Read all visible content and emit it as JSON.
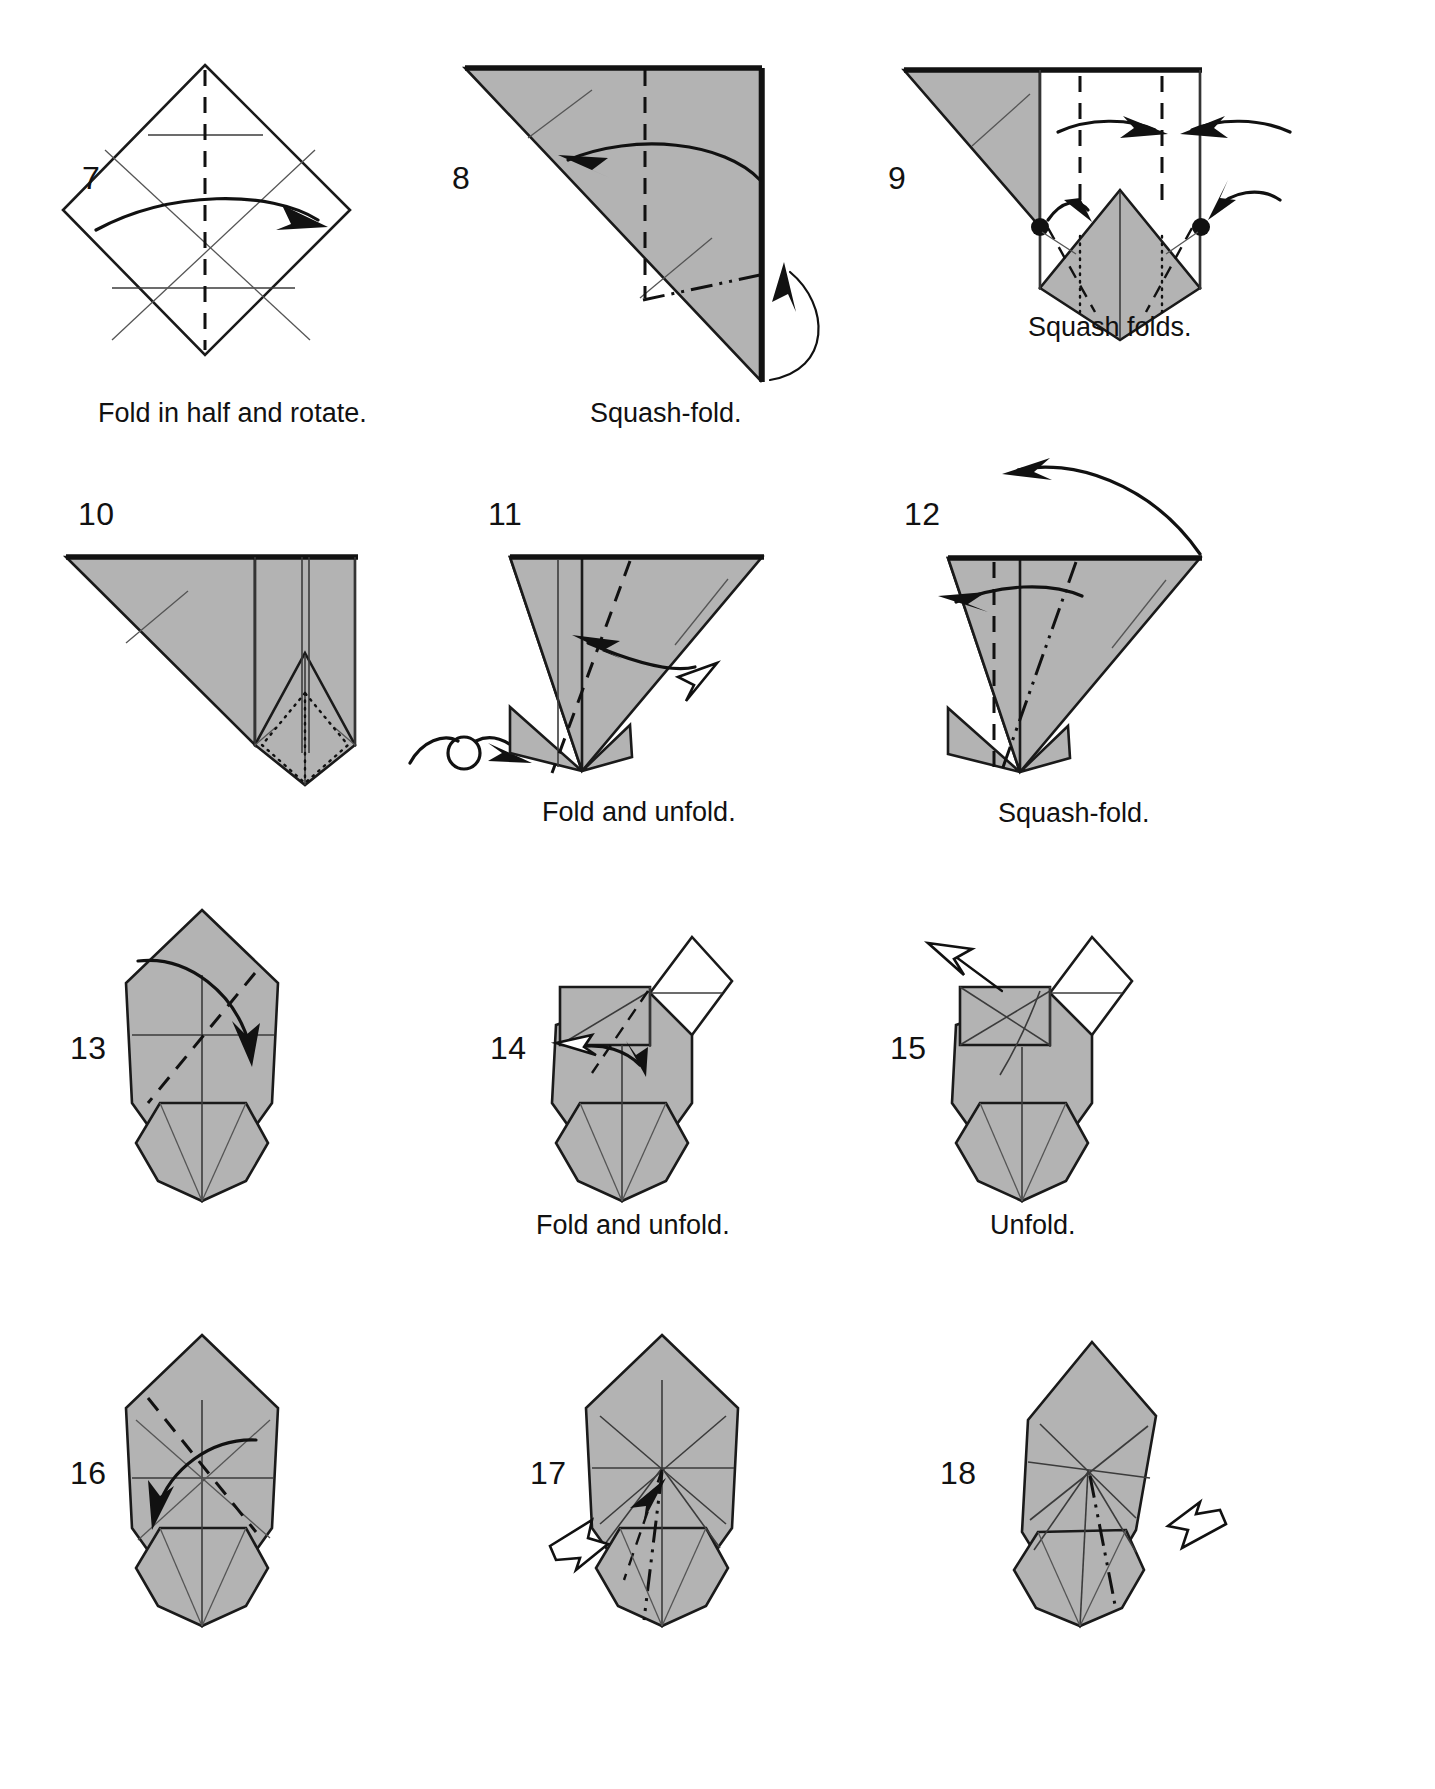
{
  "page": {
    "type": "origami-instruction-diagram",
    "background_color": "#ffffff",
    "paper_front_color": "#b3b3b3",
    "paper_back_color": "#ffffff",
    "ink_color": "#111111",
    "columns": 3,
    "rows": 4
  },
  "steps": [
    {
      "number": "7",
      "caption": "Fold in half and rotate.",
      "shape": "square rotated 45 degrees (diamond), white/unshaded",
      "creases": [
        "vertical mountain crease through center",
        "horizontal crease upper",
        "horizontal crease at center",
        "diagonal creases crossing center"
      ],
      "arrows": [
        "long horizontal valley arrow pointing right"
      ]
    },
    {
      "number": "8",
      "caption": "Squash-fold.",
      "shape": "gray right triangle, hypotenuse from top-left to bottom-right",
      "creases": [
        "vertical mountain dashed crease",
        "dash-dot (unfold / x-ray) line at lower right",
        "thin fold line"
      ],
      "arrows": [
        "curved valley arrow pointing left",
        "hooked squash arrow rising from bottom-right edge"
      ]
    },
    {
      "number": "9",
      "caption": "Squash folds.",
      "shape": "gray triangle at left joined to white panel with gray kite-shaped point below",
      "creases": [
        "two vertical mountain creases",
        "dotted hidden-edge lines on the kite",
        "dash-dot squash lines"
      ],
      "arrows": [
        "two inward horizontal arrows meeting at center",
        "two arrows pointing down-inward to the kite"
      ],
      "markers": [
        "black reference dot left",
        "black reference dot right"
      ]
    },
    {
      "number": "10",
      "caption": "",
      "shape": "gray triangle with vertical pleated band and gray kite below with dotted hidden creases",
      "creases": [
        "two vertical fold lines",
        "dotted hidden creases inside kite"
      ],
      "arrows": [
        "turn-over symbol (loop with arrow) to the right of the figure"
      ]
    },
    {
      "number": "11",
      "caption": "Fold and unfold.",
      "shape": "gray triangle pointing right with narrow gray base below",
      "creases": [
        "vertical crease",
        "diagonal mountain dashed crease"
      ],
      "arrows": [
        "double-headed fold-and-unfold arrow: solid head left, hollow head right"
      ]
    },
    {
      "number": "12",
      "caption": "Squash-fold.",
      "shape": "gray triangle pointing right with narrow gray base below",
      "creases": [
        "vertical mountain dashed crease",
        "diagonal dash-dot crease"
      ],
      "arrows": [
        "curved arrow pointing left",
        "long curved arrow sweeping up and to the left above the figure"
      ]
    },
    {
      "number": "13",
      "caption": "",
      "shape": "tall gray pentagon/kite body over a gray footed base",
      "creases": [
        "vertical center crease",
        "horizontal crease",
        "diagonal mountain dashed crease"
      ],
      "arrows": [
        "curved valley arrow sweeping right and down"
      ]
    },
    {
      "number": "14",
      "caption": "Fold and unfold.",
      "shape": "gray body with white back-side flap at top right and small gray square flap at left",
      "creases": [
        "diagonal mountain dashed crease",
        "horizontal crease in white panel",
        "vertical creases"
      ],
      "arrows": [
        "double-headed fold-and-unfold arrow with hollow head pointing left"
      ]
    },
    {
      "number": "15",
      "caption": "Unfold.",
      "shape": "gray body with white back-side flap at top right and gray square flap at left crossed by creases",
      "creases": [
        "crossed creases in left flap",
        "horizontal crease in white panel"
      ],
      "arrows": [
        "hollow (unfold) arrow pointing up-left"
      ]
    },
    {
      "number": "16",
      "caption": "",
      "shape": "tall gray pentagon/kite body over a gray footed base",
      "creases": [
        "vertical center crease",
        "horizontal crease",
        "diagonal mountain dashed crease",
        "thin diagonal creases"
      ],
      "arrows": [
        "curved valley arrow sweeping left and down"
      ]
    },
    {
      "number": "17",
      "caption": "",
      "shape": "tall gray pentagon/kite body with radiating creases over a gray footed base",
      "creases": [
        "radiating star of creases from center point",
        "dash-dot crease",
        "mountain dashed crease"
      ],
      "arrows": [
        "hollow push arrow entering from the lower left"
      ]
    },
    {
      "number": "18",
      "caption": "",
      "shape": "narrow gray body, slightly twisted, with radiating creases and a gray footed base",
      "creases": [
        "radiating creases from center",
        "dash-dot crease"
      ],
      "arrows": [
        "hollow push arrow entering from the lower right"
      ]
    }
  ]
}
